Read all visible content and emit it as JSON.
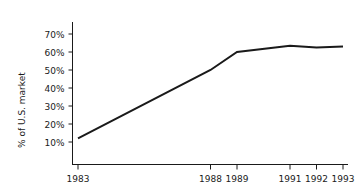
{
  "chart_data": {
    "type": "line",
    "title": "",
    "xlabel": "",
    "ylabel": "% of U.S. market",
    "x": [
      1983,
      1988,
      1989,
      1991,
      1992,
      1993
    ],
    "values": [
      12,
      50,
      60,
      63.5,
      62.5,
      63
    ],
    "series": [
      {
        "name": "% of U.S. market",
        "values": [
          12,
          50,
          60,
          63.5,
          62.5,
          63
        ]
      }
    ],
    "x_tick_labels": [
      "1983",
      "1988",
      "1989",
      "1991",
      "1992",
      "1993"
    ],
    "y_tick_labels": [
      "10%",
      "20%",
      "30%",
      "40%",
      "50%",
      "60%",
      "70%"
    ],
    "y_tick_values": [
      10,
      20,
      30,
      40,
      50,
      60,
      70
    ],
    "ylim": [
      0,
      76
    ],
    "xlim": [
      1982.4,
      1993.6
    ],
    "grid": false,
    "legend": false,
    "legend_position": "none",
    "line_color": "#1a1a1a",
    "axis_color": "#1a1a1a"
  },
  "axes": {
    "y_title": "% of U.S. market",
    "y_ticks": [
      {
        "label": "70%",
        "value": 70
      },
      {
        "label": "60%",
        "value": 60
      },
      {
        "label": "50%",
        "value": 50
      },
      {
        "label": "40%",
        "value": 40
      },
      {
        "label": "30%",
        "value": 30
      },
      {
        "label": "20%",
        "value": 20
      },
      {
        "label": "10%",
        "value": 10
      }
    ],
    "x_ticks": [
      {
        "label": "1983",
        "value": 1983
      },
      {
        "label": "1988",
        "value": 1988
      },
      {
        "label": "1989",
        "value": 1989
      },
      {
        "label": "1991",
        "value": 1991
      },
      {
        "label": "1992",
        "value": 1992
      },
      {
        "label": "1993",
        "value": 1993
      }
    ]
  }
}
